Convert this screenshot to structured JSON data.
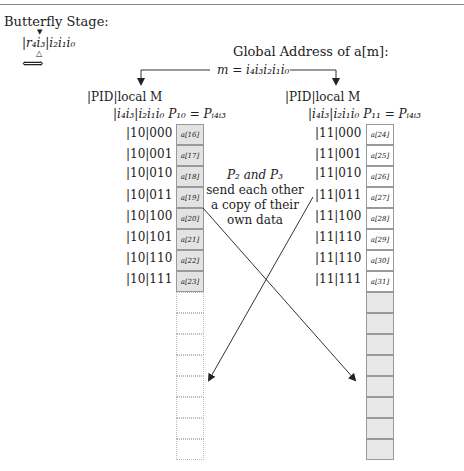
{
  "figure": {
    "title": "Butterfly Stage:",
    "stage_label": {
      "prefix": "|",
      "high_bits": "r₄i₃",
      "separator": "|",
      "low_bits": "i₂i₁i₀",
      "marker_top": "▼",
      "marker_bottom": "△",
      "swap_arrow": "⇐⇒"
    },
    "global_address": {
      "title": "Global Address of a[m]:",
      "equation": "m = i₄i₃i₂i₁i₀"
    },
    "left_processor": {
      "header_line1": "|PID|local M",
      "header_line2": "|i₄i₃|i₂i₁i₀ P₁₀ = Pᵢ₄ᵢ₃",
      "rows": [
        {
          "label": "|10|000",
          "cell": "a[16]"
        },
        {
          "label": "|10|001",
          "cell": "a[17]"
        },
        {
          "label": "|10|010",
          "cell": "a[18]"
        },
        {
          "label": "|10|011",
          "cell": "a[19]"
        },
        {
          "label": "|10|100",
          "cell": "a[20]"
        },
        {
          "label": "|10|101",
          "cell": "a[21]"
        },
        {
          "label": "|10|110",
          "cell": "a[22]"
        },
        {
          "label": "|10|111",
          "cell": "a[23]"
        }
      ],
      "empty_cells": 8,
      "filled_color": "#e3e3e3",
      "empty_style": "dotted"
    },
    "right_processor": {
      "header_line1": "|PID|local M",
      "header_line2": "|i₄i₃|i₂i₁i₀ P₁₁ = Pᵢ₄ᵢ₃",
      "rows": [
        {
          "label": "|11|000",
          "cell": "a[24]"
        },
        {
          "label": "|11|001",
          "cell": "a[25]"
        },
        {
          "label": "|11|010",
          "cell": "a[26]"
        },
        {
          "label": "|11|011",
          "cell": "a[27]"
        },
        {
          "label": "|11|100",
          "cell": "a[28]"
        },
        {
          "label": "|11|110",
          "cell": "a[29]"
        },
        {
          "label": "|11|110",
          "cell": "a[30]"
        },
        {
          "label": "|11|111",
          "cell": "a[31]"
        }
      ],
      "empty_cells": 8,
      "filled_color": "#ffffff",
      "empty_color": "#e8e8e8"
    },
    "exchange_note": {
      "line1": "P₂ and P₃",
      "line2": "send each other",
      "line3": "a copy of their",
      "line4": "own data"
    },
    "colors": {
      "line": "#333333",
      "cell_border": "#999999",
      "rule": "#888888"
    }
  }
}
